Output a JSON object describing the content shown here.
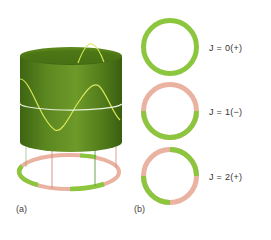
{
  "figure": {
    "panel_a": {
      "label": "(a)",
      "description": "Green cylinder with a standing wave (sinusoid) wrapped around it and a white horizontal ring; below, a base ring colored green/pink indicating wave sign",
      "colors": {
        "cylinder": "#5f8a1f",
        "cylinder_dark": "#3f6410",
        "wave": "#d8e85a",
        "ring_line": "#e8f0d8",
        "positive": "#8cc63f",
        "negative": "#eab3a1",
        "drop_line_red": "#d9867a",
        "drop_line_green": "#5aa040"
      }
    },
    "panel_b": {
      "label": "(b)",
      "rings": [
        {
          "label": "J = 0(+)",
          "segments": "all-positive"
        },
        {
          "label": "J = 1(−)",
          "segments": "top-negative-bottom-positive"
        },
        {
          "label": "J = 2(+)",
          "segments": "alternating-quarters"
        }
      ],
      "colors": {
        "positive": "#8cc63f",
        "negative": "#eab3a1"
      }
    }
  }
}
